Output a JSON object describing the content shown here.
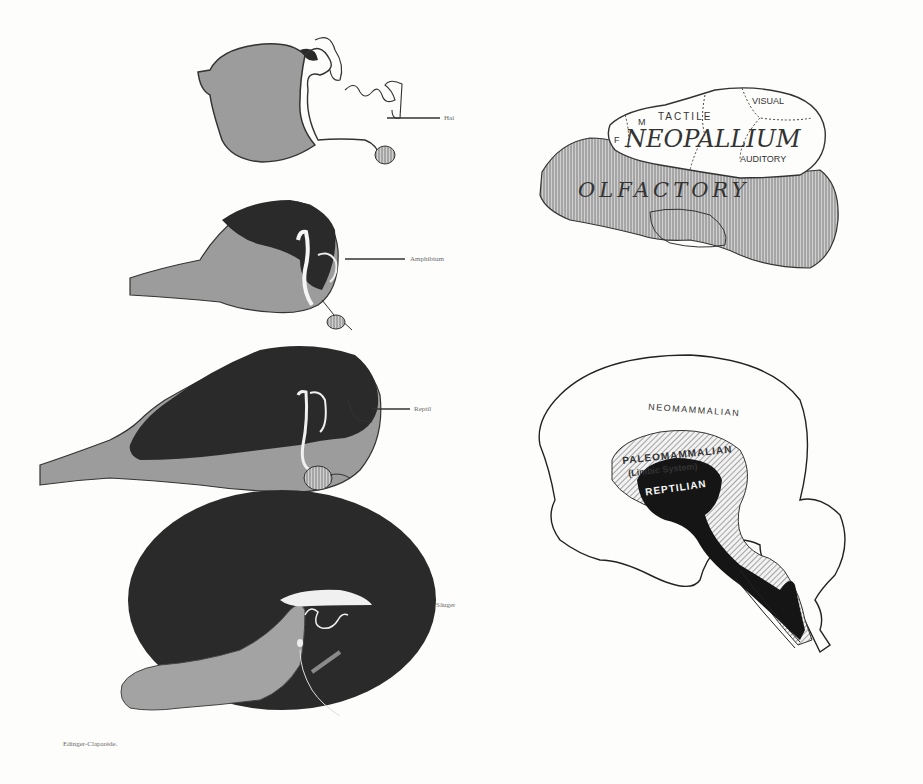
{
  "left_figure": {
    "title": "Edinger-Claparède brain evolution series",
    "brains": [
      {
        "id": "shark",
        "label": "Hai"
      },
      {
        "id": "amphibian",
        "label": "Amphibium"
      },
      {
        "id": "reptile",
        "label": "Reptil"
      },
      {
        "id": "mammal",
        "label": "Säuger"
      }
    ],
    "credit": "Edinger-Claparède."
  },
  "top_right_figure": {
    "regions": {
      "neopallium": "NEOPALLIUM",
      "olfactory": "OLFACTORY",
      "tactile": "TACTILE",
      "visual": "VISUAL",
      "auditory": "AUDITORY",
      "motor": "M",
      "frontal": "F"
    }
  },
  "bottom_right_figure": {
    "layers": {
      "outer": "NEOMAMMALIAN",
      "middle": "PALEOMAMMALIAN",
      "middle_sub": "(Limbic System)",
      "inner": "REPTILIAN"
    }
  },
  "colors": {
    "paper": "#fdfdfb",
    "dark_fill": "#2a2a2a",
    "gray_fill": "#9a9a9a",
    "hatch_fill": "#b8b8b8",
    "line": "#222222"
  }
}
